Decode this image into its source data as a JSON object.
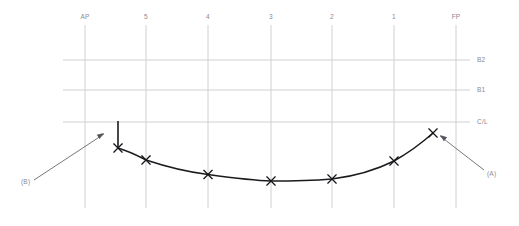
{
  "diagram": {
    "background_color": "#ffffff",
    "grid_color": "#d0d0d4",
    "curve_color": "#1b1b1f",
    "label_color": "#8a8a90",
    "leader_color": "#55555c"
  },
  "stations": [
    {
      "id": "station-ap",
      "label": "AP",
      "x": 85
    },
    {
      "id": "station-5",
      "label": "5",
      "x": 146
    },
    {
      "id": "station-4",
      "label": "4",
      "x": 208
    },
    {
      "id": "station-3",
      "label": "3",
      "x": 271
    },
    {
      "id": "station-2",
      "label": "2",
      "x": 332
    },
    {
      "id": "station-1",
      "label": "1",
      "x": 394
    },
    {
      "id": "station-fp",
      "label": "FP",
      "x": 456
    }
  ],
  "station_line_top": 25,
  "station_line_bottom": 208,
  "station_label_y": 19,
  "waterlines": [
    {
      "id": "waterline-b2",
      "label": "B2",
      "y": 60
    },
    {
      "id": "waterline-b1",
      "label": "B1",
      "y": 90
    },
    {
      "id": "waterline-cl",
      "label": "C/L",
      "y": 122
    }
  ],
  "waterline_start_x": 63,
  "waterline_end_x": 470,
  "waterline_label_x": 477,
  "sheer_curve": {
    "name": "sheer-line",
    "path": "M 118 148 C 131 152 138 156 146 160 C 170 168 188 172 208 174.5 C 230 177.5 252 180.5 271 181 C 293 181 313 180.5 332 179 C 356 176 376 170 394 161 C 410 152 424 141 433 133",
    "points": [
      {
        "name": "marker-stem",
        "x": 118,
        "y": 148
      },
      {
        "name": "marker-station-5",
        "x": 146,
        "y": 160
      },
      {
        "name": "marker-station-4",
        "x": 208,
        "y": 174.5
      },
      {
        "name": "marker-station-3",
        "x": 271,
        "y": 181
      },
      {
        "name": "marker-station-2",
        "x": 332,
        "y": 179
      },
      {
        "name": "marker-station-1",
        "x": 394,
        "y": 161
      },
      {
        "name": "marker-bow",
        "x": 433,
        "y": 133
      }
    ],
    "marker_size": 4.2
  },
  "stem_tick": {
    "name": "stem-vertical-tick",
    "x": 118,
    "y_top": 121,
    "y_bottom": 149
  },
  "callouts": [
    {
      "id": "callout-b",
      "label": "(B)",
      "label_x": 21,
      "label_y": 184,
      "line": "M 34 180 L 104 134",
      "arrow_points": "104,133 98,136 101,139",
      "arrow_rotate": -33.5,
      "arrow_x": 104,
      "arrow_y": 133
    },
    {
      "id": "callout-a",
      "label": "(A)",
      "label_x": 487,
      "label_y": 176,
      "line": "M 484 170 L 440 136",
      "arrow_points": "440,135 446,138 443,141",
      "arrow_rotate": 217.7,
      "arrow_x": 440,
      "arrow_y": 135
    }
  ]
}
